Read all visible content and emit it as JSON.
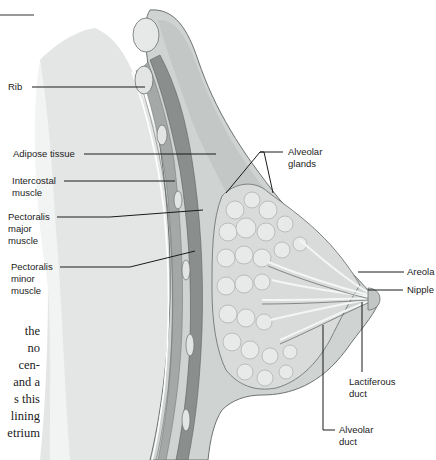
{
  "figure": {
    "colors": {
      "background": "#ffffff",
      "chest_wall": "#e6e8e8",
      "tissue": "#c9cdcc",
      "muscle": "#8d9291",
      "gland": "#d5d8d7",
      "line": "#1a1a1a",
      "text": "#222222"
    },
    "labels": [
      {
        "id": "rib",
        "text": "Rib"
      },
      {
        "id": "adipose",
        "text": "Adipose tissue"
      },
      {
        "id": "intercostal",
        "text": "Intercostal\nmuscle"
      },
      {
        "id": "pect-major",
        "text": "Pectoralis\nmajor\nmuscle"
      },
      {
        "id": "pect-minor",
        "text": "Pectoralis\nminor\nmuscle"
      },
      {
        "id": "alveolar-glands",
        "text": "Alveolar\nglands"
      },
      {
        "id": "areola",
        "text": "Areola"
      },
      {
        "id": "nipple",
        "text": "Nipple"
      },
      {
        "id": "lactiferous-duct",
        "text": "Lactiferous\nduct"
      },
      {
        "id": "alveolar-duct",
        "text": "Alveolar\nduct"
      }
    ]
  },
  "body_text": {
    "lines": [
      "the",
      "no",
      "cen-",
      "and a",
      "s this",
      "lining",
      "etrium"
    ]
  }
}
